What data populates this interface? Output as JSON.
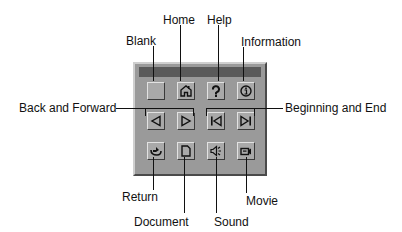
{
  "diagram": {
    "callouts": {
      "blank": "Blank",
      "home": "Home",
      "help": "Help",
      "information": "Information",
      "back_forward": "Back and Forward",
      "beginning_end": "Beginning and End",
      "return": "Return",
      "document": "Document",
      "sound": "Sound",
      "movie": "Movie"
    },
    "buttons": [
      {
        "row": 1,
        "col": 1,
        "icon": "blank",
        "callout": "Blank"
      },
      {
        "row": 1,
        "col": 2,
        "icon": "home-icon",
        "callout": "Home"
      },
      {
        "row": 1,
        "col": 3,
        "icon": "help-icon",
        "callout": "Help"
      },
      {
        "row": 1,
        "col": 4,
        "icon": "info-icon",
        "callout": "Information"
      },
      {
        "row": 2,
        "col": 1,
        "icon": "back-icon",
        "callout": "Back and Forward"
      },
      {
        "row": 2,
        "col": 2,
        "icon": "forward-icon",
        "callout": "Back and Forward"
      },
      {
        "row": 2,
        "col": 3,
        "icon": "beginning-icon",
        "callout": "Beginning and End"
      },
      {
        "row": 2,
        "col": 4,
        "icon": "end-icon",
        "callout": "Beginning and End"
      },
      {
        "row": 3,
        "col": 1,
        "icon": "return-icon",
        "callout": "Return"
      },
      {
        "row": 3,
        "col": 2,
        "icon": "document-icon",
        "callout": "Document"
      },
      {
        "row": 3,
        "col": 3,
        "icon": "sound-icon",
        "callout": "Sound"
      },
      {
        "row": 3,
        "col": 4,
        "icon": "movie-icon",
        "callout": "Movie"
      }
    ],
    "colors": {
      "panel": "#9a9a9a",
      "titlebar": "#5a5a5a",
      "button": "#a9a9a9"
    }
  }
}
